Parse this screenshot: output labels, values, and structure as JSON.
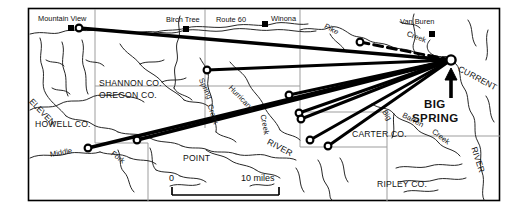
{
  "map": {
    "title": "Big Spring Dye Trace Map",
    "frame": {
      "x": 28,
      "y": 8,
      "w": 472,
      "h": 193
    },
    "colors": {
      "ink": "#000000",
      "stream": "#1a1a1a",
      "county_line": "#9a9a9a",
      "background": "#ffffff",
      "trace": "#000000"
    },
    "places": [
      {
        "name": "Mountain View",
        "label": "Mountain View",
        "x": 76,
        "y": 27,
        "marker": "town-square-and-circle"
      },
      {
        "name": "Birch Tree",
        "label": "Birch Tree",
        "x": 186,
        "y": 28,
        "marker": "town-square"
      },
      {
        "name": "Winona",
        "label": "Winona",
        "x": 265,
        "y": 24,
        "marker": "town-square"
      },
      {
        "name": "Van Buren",
        "label": "Van Buren",
        "x": 432,
        "y": 33,
        "marker": "town-square"
      },
      {
        "name": "Big Spring",
        "label": "BIG SPRING",
        "x": 451,
        "y": 60,
        "marker": "spring-circle"
      }
    ],
    "roads": [
      {
        "name": "Route 60",
        "label": "Route 60"
      }
    ],
    "counties": [
      {
        "label": "SHANNON CO.",
        "x": 99,
        "y": 83
      },
      {
        "label": "OREGON CO.",
        "x": 99,
        "y": 95
      },
      {
        "label": "HOWELL CO.",
        "x": 35,
        "y": 124
      },
      {
        "label": "CARTER CO.",
        "x": 352,
        "y": 134
      },
      {
        "label": "RIPLEY CO.",
        "x": 377,
        "y": 184
      }
    ],
    "waters": [
      {
        "label": "Spring",
        "x": 203,
        "y": 79,
        "rot": "rot-p66"
      },
      {
        "label": "Creek",
        "x": 211,
        "y": 104,
        "rot": "rot-p72"
      },
      {
        "label": "Hurricane",
        "x": 238,
        "y": 86,
        "rot": "rot-p46"
      },
      {
        "label": "Creek",
        "x": 264,
        "y": 114,
        "rot": "rot-p80"
      },
      {
        "label": "ELEVEN",
        "x": 31,
        "y": 99,
        "rot": "rot-p46"
      },
      {
        "label": "Middle",
        "x": 50,
        "y": 154,
        "rot": "rot-n10"
      },
      {
        "label": "Fork",
        "x": 112,
        "y": 152,
        "rot": "rot-p38"
      },
      {
        "label": "POINT",
        "x": 183,
        "y": 158,
        "rot": ""
      },
      {
        "label": "RIVER",
        "x": 268,
        "y": 140,
        "rot": "rot-p28"
      },
      {
        "label": "Pike",
        "x": 327,
        "y": 25,
        "rot": "rot-p28"
      },
      {
        "label": "Creek",
        "x": 409,
        "y": 33,
        "rot": "rot-p20"
      },
      {
        "label": "Big",
        "x": 385,
        "y": 110,
        "rot": "rot-p58"
      },
      {
        "label": "Barren",
        "x": 404,
        "y": 114,
        "rot": "rot-p28"
      },
      {
        "label": "Creek",
        "x": 434,
        "y": 130,
        "rot": "rot-p38"
      },
      {
        "label": "CURRENT",
        "x": 460,
        "y": 67,
        "rot": "rot-p28"
      },
      {
        "label": "RIVER",
        "x": 474,
        "y": 146,
        "rot": "rot-p72"
      }
    ],
    "dye_traces": {
      "destination": {
        "x": 451,
        "y": 60
      },
      "injection_points": [
        {
          "id": "mountain-view",
          "x": 79,
          "y": 28,
          "style": "solid"
        },
        {
          "id": "shannon-north",
          "x": 207,
          "y": 70,
          "style": "solid"
        },
        {
          "id": "hurricane-upper",
          "x": 289,
          "y": 95,
          "style": "solid"
        },
        {
          "id": "hurricane-lower",
          "x": 299,
          "y": 113,
          "style": "solid"
        },
        {
          "id": "creek-east",
          "x": 301,
          "y": 119,
          "style": "solid"
        },
        {
          "id": "river-south",
          "x": 310,
          "y": 140,
          "style": "solid"
        },
        {
          "id": "carter-west",
          "x": 328,
          "y": 146,
          "style": "solid"
        },
        {
          "id": "middle-fork-west",
          "x": 88,
          "y": 148,
          "style": "solid"
        },
        {
          "id": "eleven-point",
          "x": 137,
          "y": 140,
          "style": "solid"
        },
        {
          "id": "pike-creek",
          "x": 360,
          "y": 42,
          "style": "dashed"
        }
      ]
    },
    "scale_bar": {
      "zero_label": "0",
      "max_label": "10 miles",
      "x": 172,
      "y": 184,
      "w": 107
    },
    "arrow": {
      "name": "big-spring-pointer",
      "x": 451,
      "y": 95
    }
  }
}
